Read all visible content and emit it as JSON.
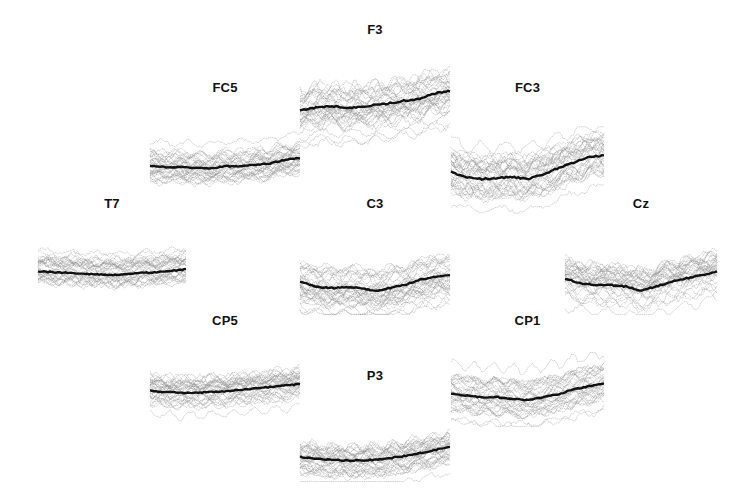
{
  "chart_data": {
    "type": "line",
    "title": "",
    "xlabel": "",
    "ylabel": "",
    "grid": false,
    "legend": null,
    "panels": [
      {
        "name": "F3",
        "x": 300,
        "y": 22,
        "w": 150,
        "h": 130,
        "title_dy": 0,
        "trace_top": 38,
        "mean": [
          0.55,
          0.52,
          0.5,
          0.52,
          0.51,
          0.49,
          0.47,
          0.44,
          0.42,
          0.36,
          0.34
        ],
        "spread": 0.22,
        "seed": 3
      },
      {
        "name": "FC5",
        "x": 150,
        "y": 80,
        "w": 150,
        "h": 115,
        "title_dy": 0,
        "trace_top": 45,
        "mean": [
          0.58,
          0.6,
          0.6,
          0.61,
          0.62,
          0.59,
          0.59,
          0.57,
          0.55,
          0.5,
          0.47
        ],
        "spread": 0.2,
        "seed": 7
      },
      {
        "name": "FC3",
        "x": 451,
        "y": 80,
        "w": 153,
        "h": 135,
        "title_dy": 0,
        "trace_top": 45,
        "mean": [
          0.52,
          0.58,
          0.6,
          0.59,
          0.58,
          0.6,
          0.55,
          0.48,
          0.42,
          0.35,
          0.34
        ],
        "spread": 0.24,
        "seed": 11
      },
      {
        "name": "T7",
        "x": 38,
        "y": 196,
        "w": 148,
        "h": 100,
        "title_dy": 0,
        "trace_top": 30,
        "mean": [
          0.65,
          0.66,
          0.67,
          0.68,
          0.69,
          0.7,
          0.69,
          0.67,
          0.66,
          0.64,
          0.62
        ],
        "spread": 0.18,
        "seed": 13
      },
      {
        "name": "C3",
        "x": 300,
        "y": 196,
        "w": 150,
        "h": 120,
        "title_dy": 0,
        "trace_top": 38,
        "mean": [
          0.58,
          0.64,
          0.66,
          0.65,
          0.66,
          0.69,
          0.66,
          0.62,
          0.56,
          0.52,
          0.5
        ],
        "spread": 0.22,
        "seed": 17
      },
      {
        "name": "Cz",
        "x": 565,
        "y": 196,
        "w": 152,
        "h": 120,
        "title_dy": 0,
        "trace_top": 38,
        "mean": [
          0.54,
          0.6,
          0.62,
          0.62,
          0.64,
          0.69,
          0.64,
          0.58,
          0.54,
          0.5,
          0.46
        ],
        "spread": 0.22,
        "seed": 19
      },
      {
        "name": "CP5",
        "x": 150,
        "y": 313,
        "w": 150,
        "h": 110,
        "title_dy": 0,
        "trace_top": 38,
        "mean": [
          0.55,
          0.57,
          0.58,
          0.58,
          0.57,
          0.56,
          0.54,
          0.52,
          0.5,
          0.48,
          0.46
        ],
        "spread": 0.2,
        "seed": 23
      },
      {
        "name": "CP1",
        "x": 451,
        "y": 313,
        "w": 153,
        "h": 115,
        "title_dy": 0,
        "trace_top": 38,
        "mean": [
          0.55,
          0.58,
          0.6,
          0.6,
          0.62,
          0.64,
          0.6,
          0.56,
          0.5,
          0.46,
          0.42
        ],
        "spread": 0.22,
        "seed": 29
      },
      {
        "name": "P3",
        "x": 300,
        "y": 368,
        "w": 150,
        "h": 115,
        "title_dy": 0,
        "trace_top": 40,
        "mean": [
          0.65,
          0.68,
          0.69,
          0.7,
          0.7,
          0.69,
          0.67,
          0.64,
          0.6,
          0.56,
          0.52
        ],
        "spread": 0.2,
        "seed": 31
      }
    ],
    "series": [
      {
        "name": "single trials",
        "color": "#8a8a8a"
      },
      {
        "name": "average",
        "color": "#111111"
      }
    ]
  }
}
